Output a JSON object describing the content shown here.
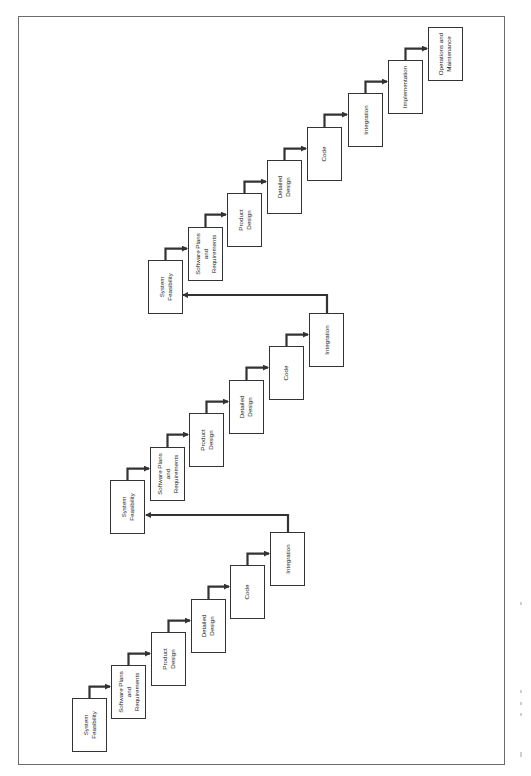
{
  "diagram": {
    "orientation": "rotated-90-ccw",
    "colors": {
      "stroke": "#333333",
      "frame": "#6a6a6a",
      "background": "#ffffff"
    },
    "box_size": {
      "w": 35,
      "h": 54
    },
    "cycles": [
      {
        "name": "cycle-1",
        "steps": [
          {
            "label": "System\nFeasibility",
            "x": 72,
            "y": 698
          },
          {
            "label": "Software Plans\nand\nRequirements",
            "x": 111,
            "y": 665
          },
          {
            "label": "Product\nDesign",
            "x": 151,
            "y": 632
          },
          {
            "label": "Detailed\nDesign",
            "x": 191,
            "y": 599
          },
          {
            "label": "Code",
            "x": 230,
            "y": 565
          },
          {
            "label": "Integration",
            "x": 270,
            "y": 532
          }
        ],
        "feedback": {
          "from_x": 288,
          "y": 515,
          "to_x": 146
        }
      },
      {
        "name": "cycle-2",
        "steps": [
          {
            "label": "System\nFeasibility",
            "x": 110,
            "y": 480
          },
          {
            "label": "Software Plans\nand\nRequirements",
            "x": 150,
            "y": 447
          },
          {
            "label": "Product\nDesign",
            "x": 189,
            "y": 413
          },
          {
            "label": "Detailed\nDesign",
            "x": 229,
            "y": 380
          },
          {
            "label": "Code",
            "x": 269,
            "y": 346
          },
          {
            "label": "Integration",
            "x": 309,
            "y": 313
          }
        ],
        "feedback": {
          "from_x": 327,
          "y": 295,
          "to_x": 183
        }
      },
      {
        "name": "cycle-3",
        "steps": [
          {
            "label": "System\nFeasibility",
            "x": 148,
            "y": 260
          },
          {
            "label": "Software Plans\nand\nRequirements",
            "x": 188,
            "y": 227
          },
          {
            "label": "Product\nDesign",
            "x": 227,
            "y": 193
          },
          {
            "label": "Detailed\nDesign",
            "x": 267,
            "y": 160
          },
          {
            "label": "Code",
            "x": 307,
            "y": 127
          },
          {
            "label": "Integration",
            "x": 348,
            "y": 93
          },
          {
            "label": "Implementation",
            "x": 388,
            "y": 60
          },
          {
            "label": "Operations and\nMaintenance",
            "x": 428,
            "y": 27
          }
        ]
      }
    ]
  }
}
